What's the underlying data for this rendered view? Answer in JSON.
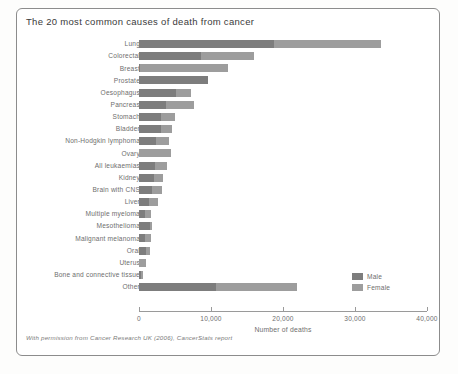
{
  "chart_title": "The 20 most common causes of death from cancer",
  "footer_note": "With permission from Cancer Research UK (2006), CancerStats report",
  "legend": {
    "position": "bottom-right",
    "entries": [
      {
        "name": "Male",
        "color": "#7d7d7d"
      },
      {
        "name": "Female",
        "color": "#9d9d9d"
      }
    ]
  },
  "colors": {
    "male": "#7d7d7d",
    "female": "#9d9d9d",
    "axis": "#9a9a9a",
    "text": "#6e6e6e",
    "frame": "#8c8c8c",
    "background": "#ffffff"
  },
  "chart_data": {
    "type": "bar",
    "orientation": "horizontal",
    "stacked": true,
    "title": "The 20 most common causes of death from cancer",
    "xlabel": "Number of deaths",
    "ylabel": "",
    "xlim": [
      0,
      40000
    ],
    "xticks": [
      0,
      10000,
      20000,
      30000,
      40000
    ],
    "xticklabels": [
      "0",
      "10,000",
      "20,000",
      "30,000",
      "40,000"
    ],
    "grid": false,
    "categories": [
      "Lung",
      "Colorectal",
      "Breast",
      "Prostate",
      "Oesophagus",
      "Pancreas",
      "Stomach",
      "Bladder",
      "Non-Hodgkin lymphoma",
      "Ovary",
      "All leukaemias",
      "Kidney",
      "Brain with CNS",
      "Liver",
      "Multiple myeloma",
      "Mesothelioma",
      "Malignant melanoma",
      "Oral",
      "Uterus",
      "Bone and connective tissue",
      "Other"
    ],
    "series": [
      {
        "name": "Male",
        "color": "#7d7d7d",
        "values": [
          18700,
          8600,
          90,
          9600,
          5100,
          3800,
          3100,
          3000,
          2300,
          0,
          2200,
          2100,
          1800,
          1400,
          900,
          1500,
          900,
          1000,
          0,
          320,
          10700
        ]
      },
      {
        "name": "Female",
        "color": "#9d9d9d",
        "values": [
          14900,
          7400,
          12300,
          0,
          2100,
          3900,
          1900,
          1600,
          1900,
          4400,
          1700,
          1200,
          1400,
          1200,
          800,
          250,
          800,
          550,
          1000,
          250,
          11300
        ]
      }
    ],
    "totals": [
      33600,
      16000,
      12390,
      9600,
      7200,
      7700,
      5000,
      4600,
      4200,
      4400,
      3900,
      3300,
      3200,
      2600,
      1700,
      1750,
      1700,
      1550,
      1000,
      570,
      22000
    ]
  },
  "geometry": {
    "x_origin_px": 139,
    "x_end_px": 427,
    "first_row_top_px": 40,
    "row_pitch_px": 12.15,
    "bar_height_px": 8,
    "axis_y_px": 311
  }
}
